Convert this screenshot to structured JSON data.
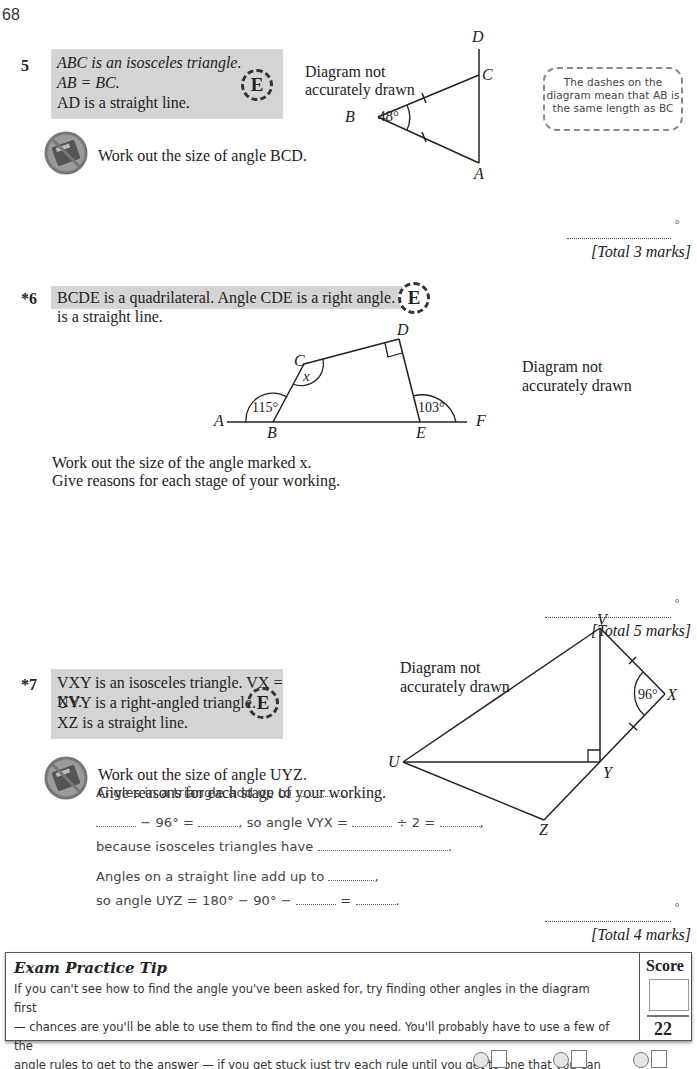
{
  "page": {
    "number": "68"
  },
  "questions": [
    {
      "number": "5",
      "statements": [
        "ABC is an isosceles triangle.",
        "AB = BC.",
        "AD is a straight line."
      ],
      "task": "Work out the size of angle BCD.",
      "diagram_note": [
        "Diagram not",
        "accurately drawn"
      ],
      "labels": {
        "A": "A",
        "B": "B",
        "C": "C",
        "D": "D",
        "angle_B": "48°"
      },
      "hint": [
        "The dashes on the",
        "diagram mean that AB is",
        "the same length as BC"
      ],
      "answer_unit": "°",
      "total": "[Total 3 marks]"
    },
    {
      "number": "*6",
      "statement": "BCDE is a quadrilateral.  Angle CDE is a right angle.  AF is a straight line.",
      "task": [
        "Work out the size of the angle marked x.",
        "Give reasons for each stage of your working."
      ],
      "diagram_note": [
        "Diagram not",
        "accurately drawn"
      ],
      "labels": {
        "A": "A",
        "B": "B",
        "C": "C",
        "D": "D",
        "E": "E",
        "F": "F",
        "x": "x",
        "angle_B": "115°",
        "angle_E": "103°"
      },
      "answer_unit": "°",
      "total": "[Total 5 marks]"
    },
    {
      "number": "*7",
      "statements": [
        "VXY is an isosceles triangle.  VX = XY.",
        "UVY is a right-angled triangle.",
        "XZ is a straight line."
      ],
      "task": [
        "Work out the size of angle UYZ.",
        "Give reasons for each stage of your working."
      ],
      "diagram_note": [
        "Diagram not",
        "accurately drawn"
      ],
      "labels": {
        "U": "U",
        "V": "V",
        "X": "X",
        "Y": "Y",
        "Z": "Z",
        "angle_X": "96°"
      },
      "working": {
        "line1": "Angles in a triangle add up to",
        "line2_a": "− 96° =",
        "line2_b": ", so angle VYX =",
        "line2_c": "÷ 2 =",
        "line3": "because isosceles triangles have",
        "line4": "Angles on a straight line add up to",
        "line5_a": "so angle UYZ = 180° − 90° −",
        "line5_b": "="
      },
      "answer_unit": "°",
      "total": "[Total 4 marks]"
    }
  ],
  "tip": {
    "title": "Exam Practice Tip",
    "lines": [
      "If you can't see how to find the angle you've been asked for, try finding other angles in the diagram first",
      "— chances are you'll be able to use them to find the one you need.  You'll probably have to use a few of the",
      "angle rules to get to the answer — if you get stuck just try each rule until you get to one that you can use."
    ],
    "score_label": "Score",
    "score_total": "22"
  },
  "icons": {
    "exam_badge": "E"
  }
}
